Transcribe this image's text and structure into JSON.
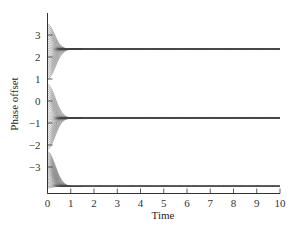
{
  "chart_data": {
    "type": "line",
    "title": "",
    "xlabel": "Time",
    "ylabel": "Phase offset",
    "xlim": [
      0,
      10
    ],
    "ylim": [
      -4,
      3.9
    ],
    "xticks": [
      0,
      1,
      2,
      3,
      4,
      5,
      6,
      7,
      8,
      9,
      10
    ],
    "yticks": [
      -3,
      -2,
      -1,
      0,
      1,
      2,
      3
    ],
    "ytick_labels": [
      "−3",
      "−2",
      "−1",
      "0",
      "1",
      "2",
      "3"
    ],
    "grid": false,
    "legend": null,
    "clusters": [
      {
        "name": "upper cluster",
        "initial_range": [
          1.0,
          3.5
        ],
        "steady_value": 2.36,
        "n_curves": 30
      },
      {
        "name": "middle cluster",
        "initial_range": [
          -2.2,
          0.75
        ],
        "steady_value": -0.78,
        "n_curves": 32
      },
      {
        "name": "lower cluster",
        "initial_range": [
          -3.95,
          -2.3
        ],
        "steady_value": -3.88,
        "n_curves": 26
      }
    ],
    "convergence_time": 2.0
  }
}
